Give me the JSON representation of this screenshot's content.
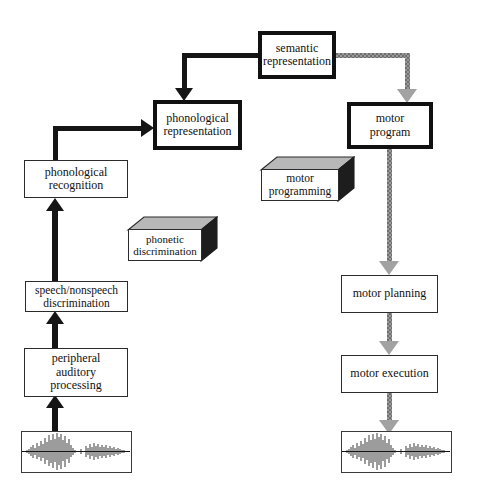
{
  "diagram": {
    "colors": {
      "stroke_black": "#151515",
      "stroke_gray": "#9a9a9a",
      "box_fill": "#ffffff",
      "note_top": "#b9b9b9",
      "note_side": "#1c1c1c"
    },
    "boxes": [
      {
        "id": "semantic_representation",
        "label": "semantic\nrepresentation",
        "border": "thick"
      },
      {
        "id": "phonological_representation",
        "label": "phonological\nrepresentation",
        "border": "thick"
      },
      {
        "id": "motor_program",
        "label": "motor\nprogram",
        "border": "thick"
      },
      {
        "id": "phonological_recognition",
        "label": "phonological\nrecognition",
        "border": "thin"
      },
      {
        "id": "speech_nonspeech_discrimination",
        "label": "speech/nonspeech\ndiscrimination",
        "border": "thin"
      },
      {
        "id": "peripheral_auditory_processing",
        "label": "peripheral\nauditory\nprocessing",
        "border": "thin"
      },
      {
        "id": "motor_planning",
        "label": "motor planning",
        "border": "thin"
      },
      {
        "id": "motor_execution",
        "label": "motor execution",
        "border": "thin"
      }
    ],
    "notes": [
      {
        "id": "motor_programming",
        "label": "motor\nprogramming"
      },
      {
        "id": "phonetic_discrimination",
        "label": "phonetic\ndiscrimination"
      }
    ],
    "waveforms": [
      {
        "id": "input_waveform",
        "label": "speech input waveform"
      },
      {
        "id": "output_waveform",
        "label": "speech output waveform"
      }
    ],
    "connectors": [
      {
        "id": "input-to-peripheral",
        "style": "black",
        "from": "input_waveform",
        "to": "peripheral_auditory_processing"
      },
      {
        "id": "peripheral-to-speech-nonspeech",
        "style": "black",
        "from": "peripheral_auditory_processing",
        "to": "speech_nonspeech_discrimination"
      },
      {
        "id": "speech-nonspeech-to-phonological-recognition",
        "style": "black",
        "from": "speech_nonspeech_discrimination",
        "to": "phonological_recognition"
      },
      {
        "id": "phonological-recognition-to-phonological-representation",
        "style": "black",
        "from": "phonological_recognition",
        "to": "phonological_representation"
      },
      {
        "id": "semantic-to-phonological-representation",
        "style": "black",
        "from": "semantic_representation",
        "to": "phonological_representation"
      },
      {
        "id": "semantic-to-motor-program",
        "style": "gray",
        "from": "semantic_representation",
        "to": "motor_program"
      },
      {
        "id": "motor-program-to-motor-planning",
        "style": "gray",
        "from": "motor_program",
        "to": "motor_planning"
      },
      {
        "id": "motor-planning-to-motor-execution",
        "style": "gray",
        "from": "motor_planning",
        "to": "motor_execution"
      },
      {
        "id": "motor-execution-to-output",
        "style": "gray",
        "from": "motor_execution",
        "to": "output_waveform"
      }
    ]
  }
}
